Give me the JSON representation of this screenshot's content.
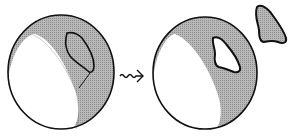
{
  "diagram": {
    "colors": {
      "stroke": "#111111",
      "shade": "#a9a9a9",
      "background": "#ffffff",
      "unshaded": "#ffffff"
    },
    "elements": [
      {
        "id": "sphere-before",
        "label": ""
      },
      {
        "id": "transform-arrow",
        "label": ""
      },
      {
        "id": "sphere-after",
        "label": ""
      },
      {
        "id": "detached-piece",
        "label": ""
      }
    ]
  }
}
